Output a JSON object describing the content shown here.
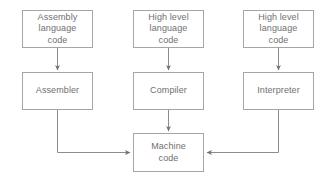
{
  "diagram": {
    "colors": {
      "box_border": "#a6a6a6",
      "text": "#70706f",
      "connector": "#8c8c8c",
      "background": "#ffffff"
    },
    "nodes": {
      "assembly_source": "Assembly\nlanguage\ncode",
      "highlevel_source_compiler": "High level\nlanguage\ncode",
      "highlevel_source_interpreter": "High level\nlanguage\ncode",
      "assembler": "Assembler",
      "compiler": "Compiler",
      "interpreter": "Interpreter",
      "machine_code": "Machine\ncode"
    },
    "edges": [
      {
        "from": "assembly_source",
        "to": "assembler",
        "style": "arrow-down"
      },
      {
        "from": "highlevel_source_compiler",
        "to": "compiler",
        "style": "arrow-down"
      },
      {
        "from": "highlevel_source_interpreter",
        "to": "interpreter",
        "style": "arrow-down"
      },
      {
        "from": "assembler",
        "to": "machine_code",
        "style": "elbow-down-right-arrow"
      },
      {
        "from": "compiler",
        "to": "machine_code",
        "style": "arrow-down"
      },
      {
        "from": "interpreter",
        "to": "machine_code",
        "style": "elbow-down-left-arrow"
      }
    ]
  }
}
